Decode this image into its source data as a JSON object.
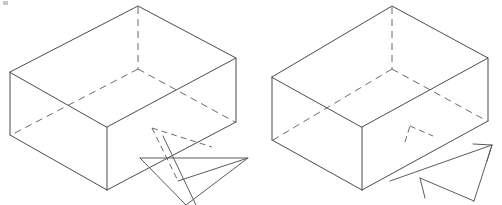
{
  "figure": {
    "title": "Two isometric open-box wireframe diagrams with motion arrows",
    "background_color": "#ffffff",
    "line_color": "#4a4a52",
    "hidden_line_color": "#6a6a72",
    "width": 502,
    "height": 205,
    "panel_count": 2,
    "panels": [
      {
        "id": "left-figure",
        "label": "left open box with arrow passing through the base",
        "box": {
          "label": "open rectangular box, isometric view, top face open",
          "top_rim": {
            "back_apex": [
              138,
              6
            ],
            "left": [
              10,
              72
            ],
            "front": [
              107,
              127
            ],
            "right": [
              236,
              58
            ]
          },
          "bottom": {
            "left": [
              10,
              135
            ],
            "front": [
              107,
              190
            ],
            "right": [
              236,
              122
            ]
          },
          "visible_vertical_edges": [
            [
              10,
              72,
              10,
              135
            ],
            [
              107,
              127,
              107,
              190
            ],
            [
              236,
              58,
              236,
              122
            ]
          ],
          "hidden_edges": [
            "back vertical edge from top apex downward",
            "inner bottom-face left edge",
            "inner bottom-face right edge"
          ],
          "hidden_vertical": [
            138,
            6,
            138,
            69
          ],
          "inner_bottom_corner": [
            138,
            69
          ]
        },
        "arrow": {
          "label": "flat triangular arrow pointing right-upward, shaft crossing the box base",
          "style": "solid-outline-triangle",
          "head_tip": [
            248,
            158
          ],
          "tail_points": [
            [
              152,
              134
            ],
            [
              186,
              205
            ]
          ],
          "dashed_guide": true
        }
      },
      {
        "id": "right-figure",
        "label": "right open box with arrow positioned below and to the right",
        "box": {
          "label": "open rectangular box, isometric view, top face open",
          "top_rim": {
            "back_apex": [
              392,
              6
            ],
            "left": [
              272,
              77
            ],
            "front": [
              362,
              127
            ],
            "right": [
              488,
              58
            ]
          },
          "bottom": {
            "left": [
              272,
              140
            ],
            "front": [
              362,
              190
            ],
            "right": [
              488,
              121
            ]
          },
          "visible_vertical_edges": [
            [
              272,
              77,
              272,
              140
            ],
            [
              362,
              127,
              362,
              190
            ],
            [
              488,
              58,
              488,
              121
            ]
          ],
          "hidden_edges": [
            "back vertical edge from top apex downward",
            "inner bottom-face left edge",
            "inner bottom-face right edge"
          ],
          "hidden_vertical": [
            392,
            6,
            392,
            69
          ],
          "inner_bottom_corner": [
            392,
            69
          ]
        },
        "arrow": {
          "label": "flat triangular arrow pointing left-downward, below the box",
          "style": "solid-outline-triangle",
          "head_tip": [
            390,
            181
          ],
          "tail_points": [
            [
              492,
              145
            ],
            [
              474,
              201
            ]
          ],
          "small_dashed_arrowhead": {
            "label": "short dashed direction marker above main arrow",
            "tip": [
              408,
              126
            ],
            "points": [
              [
                404,
                142
              ],
              [
                410,
                125
              ],
              [
                432,
                135
              ]
            ]
          }
        }
      }
    ],
    "artifacts": [
      {
        "name": "corner-speck",
        "position": [
          4,
          2
        ],
        "size": 4
      }
    ]
  }
}
